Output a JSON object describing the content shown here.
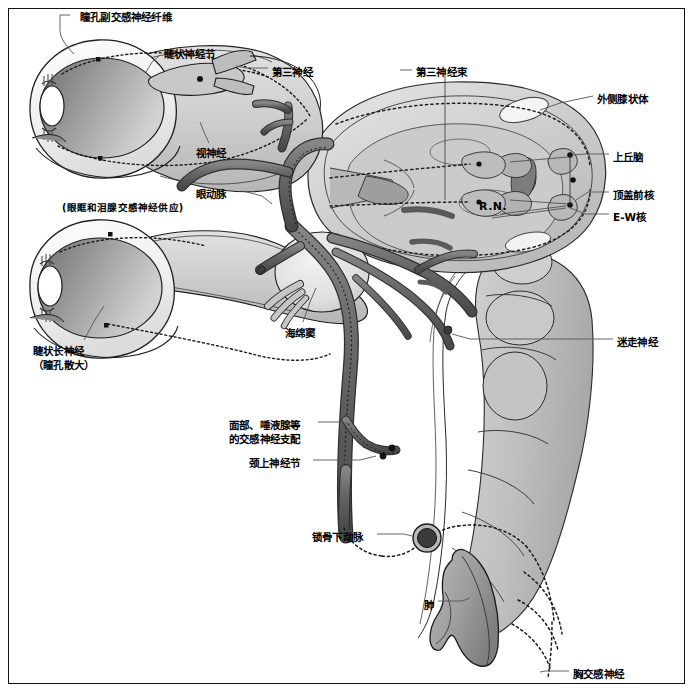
{
  "figure": {
    "border_color": "#111111",
    "background": "#ffffff"
  },
  "palette": {
    "artery_dark": "#6a6a6a",
    "artery_edge": "#3a3a3a",
    "nerve_fill": "#cfcfcf",
    "tissue_light": "#d8d8d8",
    "tissue_mid": "#c2c2c2",
    "globe_dark": "#7d7d7d",
    "globe_light": "#e8e8e8",
    "pupil": "#ffffff",
    "outline": "#1a1a1a",
    "leader": "#555555",
    "dotted": "#222222"
  },
  "labels": [
    {
      "id": "pupillary-parasympathetic-fibers",
      "text": "瞳孔副交感神经纤维",
      "x": 80,
      "y": 11,
      "align": "left"
    },
    {
      "id": "ciliary-ganglion",
      "text": "睫状神经节",
      "x": 164,
      "y": 48,
      "align": "left"
    },
    {
      "id": "third-nerve",
      "text": "第三神经",
      "x": 272,
      "y": 66,
      "align": "left"
    },
    {
      "id": "third-nerve-tract",
      "text": "第三神经束",
      "x": 416,
      "y": 66,
      "align": "left"
    },
    {
      "id": "lateral-geniculate-body",
      "text": "外侧膝状体",
      "x": 597,
      "y": 93,
      "align": "left"
    },
    {
      "id": "optic-nerve",
      "text": "视神经",
      "x": 196,
      "y": 147,
      "align": "left"
    },
    {
      "id": "superior-colliculus",
      "text": "上丘脑",
      "x": 613,
      "y": 151,
      "align": "left"
    },
    {
      "id": "pretectal-nucleus",
      "text": "顶盖前核",
      "x": 613,
      "y": 189,
      "align": "left"
    },
    {
      "id": "ophthalmic-artery",
      "text": "眼动脉",
      "x": 196,
      "y": 188,
      "align": "left"
    },
    {
      "id": "ophthalmic-artery-sub",
      "text": "(眼眶和泪腺交感神经供应)",
      "x": 62,
      "y": 201,
      "align": "left"
    },
    {
      "id": "ew-nucleus",
      "text": "E-W核",
      "x": 613,
      "y": 211,
      "align": "left"
    },
    {
      "id": "cavernous-sinus",
      "text": "海绵窦",
      "x": 285,
      "y": 327,
      "align": "left"
    },
    {
      "id": "vagus-nerve",
      "text": "迷走神经",
      "x": 617,
      "y": 336,
      "align": "left"
    },
    {
      "id": "long-ciliary-nerve",
      "text": "睫状长神经",
      "x": 33,
      "y": 345,
      "align": "left"
    },
    {
      "id": "long-ciliary-nerve-sub",
      "text": "（瞳孔散大）",
      "x": 33,
      "y": 359,
      "align": "left"
    },
    {
      "id": "facial-salivary-sympathetic",
      "text": "面部、唾液腺等",
      "x": 229,
      "y": 419,
      "align": "left"
    },
    {
      "id": "facial-salivary-sympathetic-2",
      "text": "的交感神经支配",
      "x": 229,
      "y": 433,
      "align": "left"
    },
    {
      "id": "superior-cervical-ganglion",
      "text": "颈上神经节",
      "x": 249,
      "y": 457,
      "align": "left"
    },
    {
      "id": "subclavian-artery",
      "text": "锁骨下动脉",
      "x": 312,
      "y": 531,
      "align": "left"
    },
    {
      "id": "lung",
      "text": "肺",
      "x": 424,
      "y": 599,
      "align": "left"
    },
    {
      "id": "thoracic-sympathetic-nerve",
      "text": "胸交感神经",
      "x": 573,
      "y": 668,
      "align": "left"
    },
    {
      "id": "red-nucleus",
      "text": "R.N.",
      "x": 479,
      "y": 200,
      "align": "left"
    }
  ],
  "structures": {
    "eyes": [
      {
        "id": "upper-eye",
        "label": "上眼球"
      },
      {
        "id": "lower-eye",
        "label": "下眼球"
      }
    ],
    "midbrain": {
      "id": "midbrain",
      "label": "中脑"
    },
    "brainstem": {
      "id": "brainstem",
      "label": "脑干"
    },
    "lung": {
      "id": "lung-shape",
      "label": "肺"
    },
    "subclavian": {
      "id": "subclavian-artery-ring",
      "label": "锁骨下动脉环"
    },
    "cavernous_sinus": {
      "id": "cavernous-sinus-shape",
      "label": "海绵窦"
    }
  }
}
